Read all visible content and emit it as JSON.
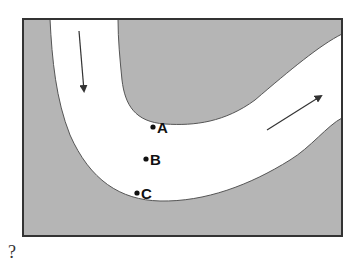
{
  "figure": {
    "colors": {
      "land": "#b5b5b5",
      "river": "#ffffff",
      "border": "#333333",
      "arrow": "#333333"
    },
    "points": [
      {
        "label": "A",
        "position": "inner bank of bend"
      },
      {
        "label": "B",
        "position": "middle of channel"
      },
      {
        "label": "C",
        "position": "outer bank of bend"
      }
    ],
    "arrows": [
      {
        "name": "upstream-flow",
        "direction": "down"
      },
      {
        "name": "downstream-flow",
        "direction": "up-right"
      }
    ],
    "question_mark": "?"
  }
}
